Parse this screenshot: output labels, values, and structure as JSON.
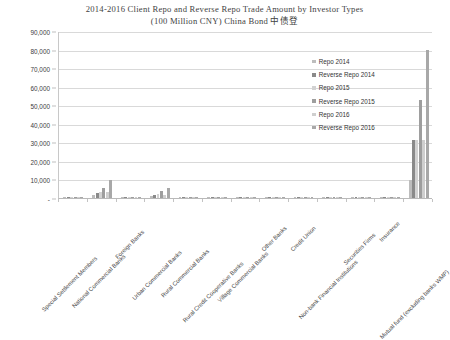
{
  "chart_data": {
    "type": "bar",
    "title": "2014-2016 Client Repo and Reverse Repo Trade Amount by Investor Types",
    "subtitle": "(100 Million CNY) China Bond 中债登",
    "title_lines": [
      "2014-2016 Client Repo and Reverse Repo Trade Amount by Investor Types",
      "(100 Million CNY) China Bond 中债登"
    ],
    "xlabel": "",
    "ylabel": "",
    "ylim": [
      0,
      90000
    ],
    "ytick_step": 10000,
    "grid": true,
    "legend_position": "inside-top-right",
    "ytick_labels": [
      "90,000",
      "80,000",
      "70,000",
      "60,000",
      "50,000",
      "40,000",
      "30,000",
      "20,000",
      "10,000",
      "-"
    ],
    "ytick_values": [
      90000,
      80000,
      70000,
      60000,
      50000,
      40000,
      30000,
      20000,
      10000,
      0
    ],
    "categories": [
      "Special Settlement Members",
      "National Commercial Banks",
      "Foreign Banks",
      "Urban Commercial Banks",
      "Rural Commercial Banks",
      "Rural Credit Cooperative Banks",
      "Village Commercial Banks",
      "Other Banks",
      "Credit Union",
      "Non-bank Financial Institutions",
      "Securities Firms",
      "Insurance",
      "Mutual fund (excluding banks WMP)"
    ],
    "series": [
      {
        "name": "Repo 2014",
        "color": "#bdbdbd",
        "values": [
          120,
          1400,
          260,
          900,
          240,
          180,
          60,
          150,
          90,
          210,
          320,
          260,
          9500
        ]
      },
      {
        "name": "Reverse Repo 2014",
        "color": "#8a8a8a",
        "values": [
          90,
          2600,
          340,
          1500,
          300,
          210,
          70,
          180,
          110,
          260,
          380,
          300,
          31500
        ]
      },
      {
        "name": "Repo 2015",
        "color": "#d2d2d2",
        "values": [
          140,
          3400,
          420,
          2100,
          360,
          240,
          80,
          200,
          120,
          300,
          430,
          340,
          31200
        ]
      },
      {
        "name": "Reverse Repo 2015",
        "color": "#9e9e9e",
        "values": [
          110,
          5600,
          560,
          3900,
          430,
          280,
          90,
          230,
          140,
          350,
          500,
          390,
          53000
        ]
      },
      {
        "name": "Repo 2016",
        "color": "#cfcfcf",
        "values": [
          160,
          3200,
          380,
          1800,
          330,
          230,
          75,
          190,
          115,
          290,
          410,
          330,
          31000
        ]
      },
      {
        "name": "Reverse Repo 2016",
        "color": "#a8a8a8",
        "values": [
          130,
          9800,
          640,
          5200,
          480,
          310,
          95,
          250,
          150,
          380,
          540,
          420,
          79800
        ]
      }
    ]
  }
}
